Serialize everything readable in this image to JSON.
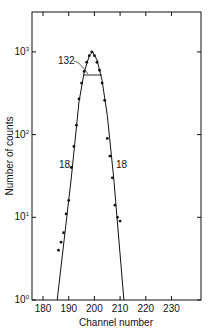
{
  "chart_data": {
    "type": "scatter",
    "title": "",
    "xlabel": "Channel number",
    "ylabel": "Number of counts",
    "xlim": [
      175.7,
      241.5
    ],
    "ylim": [
      1,
      3000
    ],
    "yscale": "log",
    "xticks": [
      180,
      190,
      200,
      210,
      220,
      230
    ],
    "xtick_labels": [
      "180",
      "190",
      "200",
      "210",
      "220",
      "230"
    ],
    "yticks": [
      1,
      10,
      100,
      1000
    ],
    "ytick_labels": [
      "10⁰",
      "10¹",
      "10²",
      "10³"
    ],
    "grid": false,
    "legend": null,
    "series": [
      {
        "name": "measured counts",
        "style": "points",
        "x": [
          186,
          187,
          188,
          189,
          190,
          191,
          192,
          193,
          194,
          195,
          196,
          197,
          198,
          199,
          200,
          201,
          202,
          203,
          204,
          205,
          206,
          207,
          208,
          209,
          210
        ],
        "y": [
          4,
          5,
          6.5,
          11,
          16,
          40,
          72,
          130,
          270,
          420,
          580,
          750,
          900,
          1000,
          900,
          750,
          600,
          420,
          260,
          90,
          55,
          30,
          14,
          10,
          9
        ]
      },
      {
        "name": "fitted gaussian",
        "style": "line",
        "x": [
          185.5,
          191,
          194,
          196,
          198,
          199.3,
          201,
          203,
          205,
          207.5,
          211.5
        ],
        "y": [
          1,
          30,
          250,
          560,
          900,
          1000,
          800,
          450,
          170,
          30,
          1
        ]
      }
    ],
    "annotations": [
      {
        "text": "132",
        "note": "FWHM marker line at half maximum",
        "x": 197,
        "y": 700
      },
      {
        "text": "18",
        "note": "left slope label",
        "x": 189,
        "y": 33
      },
      {
        "text": "18",
        "note": "right slope label",
        "x": 208,
        "y": 33
      }
    ]
  }
}
